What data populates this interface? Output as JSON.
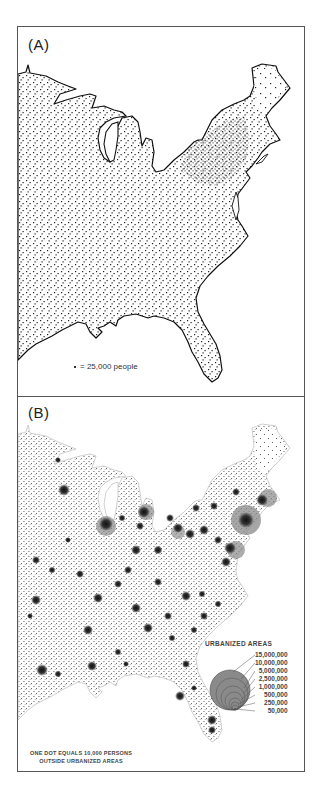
{
  "figure": {
    "panels": [
      {
        "id": "A",
        "label": "(A)",
        "legend": {
          "dot_symbol": "•",
          "text": "= 25,000 people",
          "dot_value_persons": 25000
        }
      },
      {
        "id": "B",
        "label": "(B)",
        "urbanized_areas_legend": {
          "title": "URBANIZED AREAS",
          "sizes": [
            "15,000,000",
            "10,000,000",
            "5,000,000",
            "2,500,000",
            "1,000,000",
            "500,000",
            "250,000",
            "50,000"
          ]
        },
        "note_line1": "ONE DOT EQUALS 10,000  PERSONS",
        "note_line2": "OUTSIDE URBANIZED AREAS",
        "dot_value_persons": 10000
      }
    ],
    "colors": {
      "border": "#555555",
      "dot": "#222222",
      "urban_circle": "#8a8a8a",
      "coastline_a": "#111111",
      "coastline_b": "#cfcfcf"
    }
  }
}
